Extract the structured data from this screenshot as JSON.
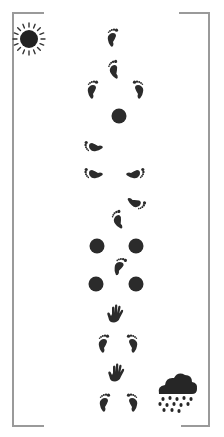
{
  "scene": {
    "background": "#ffffff",
    "ink_color": "#2b2b2b",
    "frame_color": "#9a9a9a"
  },
  "icons": {
    "sun": {
      "name": "sun-icon",
      "x": 12,
      "y": 22,
      "size": 34
    },
    "cloud": {
      "name": "rain-cloud-icon",
      "x": 155,
      "y": 368,
      "w": 44,
      "h": 46
    },
    "sequence": [
      {
        "type": "foot",
        "side": "left",
        "x": 105,
        "y": 28,
        "rot": 0
      },
      {
        "type": "foot",
        "side": "left",
        "x": 107,
        "y": 60,
        "rot": -20
      },
      {
        "type": "foot",
        "side": "left",
        "x": 85,
        "y": 80,
        "rot": 0
      },
      {
        "type": "foot",
        "side": "right",
        "x": 130,
        "y": 80,
        "rot": 0
      },
      {
        "type": "dot",
        "x": 111,
        "y": 108
      },
      {
        "type": "foot",
        "side": "left",
        "x": 86,
        "y": 136,
        "rot": -90
      },
      {
        "type": "foot",
        "side": "left",
        "x": 86,
        "y": 163,
        "rot": -90
      },
      {
        "type": "foot",
        "side": "right",
        "x": 127,
        "y": 163,
        "rot": 90
      },
      {
        "type": "foot",
        "side": "right",
        "x": 128,
        "y": 192,
        "rot": 120
      },
      {
        "type": "foot",
        "side": "left",
        "x": 111,
        "y": 210,
        "rot": -25
      },
      {
        "type": "dot",
        "x": 89,
        "y": 238
      },
      {
        "type": "dot",
        "x": 128,
        "y": 238
      },
      {
        "type": "foot",
        "side": "left",
        "x": 112,
        "y": 257,
        "rot": 15
      },
      {
        "type": "dot",
        "x": 88,
        "y": 276
      },
      {
        "type": "dot",
        "x": 128,
        "y": 276
      },
      {
        "type": "hand",
        "x": 106,
        "y": 304
      },
      {
        "type": "foot",
        "side": "left",
        "x": 96,
        "y": 334,
        "rot": 0
      },
      {
        "type": "foot",
        "side": "right",
        "x": 124,
        "y": 334,
        "rot": 0
      },
      {
        "type": "hand",
        "x": 107,
        "y": 363
      },
      {
        "type": "foot",
        "side": "left",
        "x": 97,
        "y": 393,
        "rot": 0
      },
      {
        "type": "foot",
        "side": "right",
        "x": 124,
        "y": 393,
        "rot": 0
      }
    ]
  }
}
